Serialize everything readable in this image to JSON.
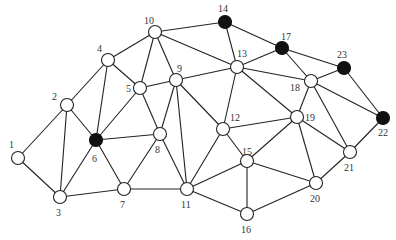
{
  "graph": {
    "node_radius": 6.5,
    "colors": {
      "edge": "#222222",
      "open_fill": "#ffffff",
      "filled": "#111111",
      "label": "#333333"
    },
    "nodes": [
      {
        "id": "1",
        "x": 18,
        "y": 158,
        "filled": false,
        "lx": 9,
        "ly": 148
      },
      {
        "id": "2",
        "x": 67,
        "y": 105,
        "filled": false,
        "lx": 52,
        "ly": 100
      },
      {
        "id": "3",
        "x": 60,
        "y": 197,
        "filled": false,
        "lx": 56,
        "ly": 216
      },
      {
        "id": "4",
        "x": 108,
        "y": 60,
        "filled": false,
        "lx": 97,
        "ly": 52
      },
      {
        "id": "5",
        "x": 140,
        "y": 88,
        "filled": false,
        "lx": 126,
        "ly": 92
      },
      {
        "id": "6",
        "x": 96,
        "y": 140,
        "filled": true,
        "lx": 92,
        "ly": 162
      },
      {
        "id": "7",
        "x": 124,
        "y": 189,
        "filled": false,
        "lx": 120,
        "ly": 208
      },
      {
        "id": "8",
        "x": 160,
        "y": 134,
        "filled": false,
        "lx": 155,
        "ly": 153
      },
      {
        "id": "9",
        "x": 176,
        "y": 80,
        "filled": false,
        "lx": 177,
        "ly": 72
      },
      {
        "id": "10",
        "x": 155,
        "y": 32,
        "filled": false,
        "lx": 144,
        "ly": 24
      },
      {
        "id": "11",
        "x": 187,
        "y": 189,
        "filled": false,
        "lx": 181,
        "ly": 208
      },
      {
        "id": "12",
        "x": 223,
        "y": 129,
        "filled": false,
        "lx": 230,
        "ly": 121
      },
      {
        "id": "13",
        "x": 237,
        "y": 67,
        "filled": false,
        "lx": 237,
        "ly": 57
      },
      {
        "id": "14",
        "x": 225,
        "y": 22,
        "filled": true,
        "lx": 218,
        "ly": 12
      },
      {
        "id": "15",
        "x": 247,
        "y": 161,
        "filled": false,
        "lx": 242,
        "ly": 155
      },
      {
        "id": "16",
        "x": 247,
        "y": 214,
        "filled": false,
        "lx": 241,
        "ly": 233
      },
      {
        "id": "17",
        "x": 282,
        "y": 48,
        "filled": true,
        "lx": 281,
        "ly": 40
      },
      {
        "id": "18",
        "x": 311,
        "y": 81,
        "filled": false,
        "lx": 290,
        "ly": 91
      },
      {
        "id": "19",
        "x": 297,
        "y": 117,
        "filled": false,
        "lx": 305,
        "ly": 121
      },
      {
        "id": "20",
        "x": 316,
        "y": 183,
        "filled": false,
        "lx": 310,
        "ly": 202
      },
      {
        "id": "21",
        "x": 350,
        "y": 152,
        "filled": false,
        "lx": 344,
        "ly": 171
      },
      {
        "id": "22",
        "x": 383,
        "y": 118,
        "filled": true,
        "lx": 378,
        "ly": 136
      },
      {
        "id": "23",
        "x": 344,
        "y": 68,
        "filled": true,
        "lx": 337,
        "ly": 58
      }
    ],
    "edges": [
      [
        "1",
        "2"
      ],
      [
        "1",
        "3"
      ],
      [
        "2",
        "3"
      ],
      [
        "2",
        "4"
      ],
      [
        "2",
        "6"
      ],
      [
        "3",
        "6"
      ],
      [
        "3",
        "7"
      ],
      [
        "4",
        "6"
      ],
      [
        "4",
        "5"
      ],
      [
        "4",
        "10"
      ],
      [
        "5",
        "6"
      ],
      [
        "5",
        "10"
      ],
      [
        "5",
        "9"
      ],
      [
        "5",
        "8"
      ],
      [
        "6",
        "7"
      ],
      [
        "6",
        "8"
      ],
      [
        "7",
        "8"
      ],
      [
        "7",
        "11"
      ],
      [
        "8",
        "9"
      ],
      [
        "8",
        "11"
      ],
      [
        "9",
        "10"
      ],
      [
        "9",
        "11"
      ],
      [
        "9",
        "13"
      ],
      [
        "9",
        "12"
      ],
      [
        "10",
        "14"
      ],
      [
        "10",
        "13"
      ],
      [
        "11",
        "12"
      ],
      [
        "11",
        "15"
      ],
      [
        "11",
        "16"
      ],
      [
        "12",
        "13"
      ],
      [
        "12",
        "15"
      ],
      [
        "12",
        "19"
      ],
      [
        "13",
        "14"
      ],
      [
        "13",
        "17"
      ],
      [
        "13",
        "18"
      ],
      [
        "13",
        "19"
      ],
      [
        "14",
        "17"
      ],
      [
        "15",
        "16"
      ],
      [
        "15",
        "19"
      ],
      [
        "15",
        "20"
      ],
      [
        "16",
        "20"
      ],
      [
        "17",
        "18"
      ],
      [
        "17",
        "23"
      ],
      [
        "18",
        "19"
      ],
      [
        "18",
        "23"
      ],
      [
        "18",
        "22"
      ],
      [
        "18",
        "21"
      ],
      [
        "19",
        "21"
      ],
      [
        "19",
        "20"
      ],
      [
        "20",
        "21"
      ],
      [
        "21",
        "22"
      ],
      [
        "22",
        "23"
      ]
    ]
  }
}
